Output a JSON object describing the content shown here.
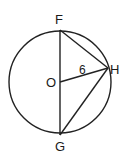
{
  "diagram": {
    "type": "circle-geometry",
    "circle": {
      "center": "O",
      "stroke": "#222222"
    },
    "points": {
      "F": {
        "label": "F"
      },
      "G": {
        "label": "G"
      },
      "H": {
        "label": "H"
      },
      "O": {
        "label": "O"
      }
    },
    "segments": [
      {
        "from": "F",
        "to": "G",
        "role": "diameter"
      },
      {
        "from": "F",
        "to": "H",
        "role": "chord"
      },
      {
        "from": "G",
        "to": "H",
        "role": "chord"
      },
      {
        "from": "O",
        "to": "H",
        "role": "radius",
        "label": "6"
      }
    ],
    "radius_label": "6"
  }
}
